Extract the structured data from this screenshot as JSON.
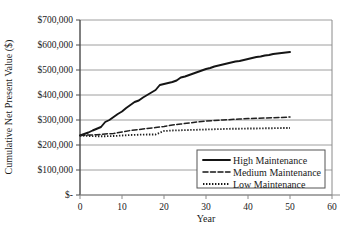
{
  "chart_data": {
    "type": "line",
    "title": "",
    "xlabel": "Year",
    "ylabel": "Cumulative Net Present Value ($)",
    "xlim": [
      0,
      60
    ],
    "ylim": [
      0,
      700000
    ],
    "grid": "horizontal",
    "legend_position": "bottom-right",
    "x_ticks": [
      "0",
      "10",
      "20",
      "30",
      "40",
      "50",
      "60"
    ],
    "x_tick_values": [
      0,
      10,
      20,
      30,
      40,
      50,
      60
    ],
    "y_ticks": [
      "$-",
      "$100,000",
      "$200,000",
      "$300,000",
      "$400,000",
      "$500,000",
      "$600,000",
      "$700,000"
    ],
    "y_tick_values": [
      0,
      100000,
      200000,
      300000,
      400000,
      500000,
      600000,
      700000
    ],
    "series": [
      {
        "name": "High Maintenance",
        "style": "solid",
        "color": "#151515",
        "x": [
          0,
          1,
          2,
          3,
          4,
          5,
          6,
          7,
          8,
          9,
          10,
          11,
          12,
          13,
          14,
          15,
          16,
          17,
          18,
          19,
          20,
          21,
          22,
          23,
          24,
          25,
          26,
          27,
          28,
          29,
          30,
          31,
          32,
          33,
          34,
          35,
          36,
          37,
          38,
          39,
          40,
          41,
          42,
          43,
          44,
          45,
          46,
          47,
          48,
          49,
          50
        ],
        "values": [
          238000,
          244000,
          250000,
          258000,
          265000,
          272000,
          292000,
          300000,
          312000,
          324000,
          334000,
          348000,
          360000,
          372000,
          378000,
          390000,
          400000,
          410000,
          420000,
          440000,
          444000,
          448000,
          452000,
          458000,
          470000,
          474000,
          480000,
          486000,
          492000,
          498000,
          504000,
          508000,
          514000,
          518000,
          522000,
          526000,
          530000,
          534000,
          536000,
          540000,
          544000,
          548000,
          552000,
          554000,
          558000,
          560000,
          564000,
          566000,
          568000,
          570000,
          572000
        ]
      },
      {
        "name": "Medium Maintenance",
        "style": "dashed",
        "color": "#202020",
        "x": [
          0,
          2,
          4,
          6,
          8,
          10,
          12,
          14,
          16,
          18,
          20,
          22,
          24,
          26,
          28,
          30,
          32,
          34,
          36,
          38,
          40,
          42,
          44,
          46,
          48,
          50
        ],
        "values": [
          238000,
          240000,
          241000,
          244000,
          246000,
          252000,
          258000,
          262000,
          266000,
          270000,
          274000,
          280000,
          284000,
          288000,
          292000,
          296000,
          298000,
          300000,
          302000,
          304000,
          306000,
          307000,
          308000,
          309000,
          310000,
          312000
        ]
      },
      {
        "name": "Low Maintenance",
        "style": "dotted",
        "color": "#202020",
        "x": [
          0,
          2,
          4,
          6,
          8,
          10,
          12,
          14,
          16,
          18,
          20,
          22,
          24,
          26,
          28,
          30,
          32,
          34,
          36,
          38,
          40,
          42,
          44,
          46,
          48,
          50
        ],
        "values": [
          238000,
          236000,
          235000,
          235000,
          236000,
          238000,
          240000,
          241000,
          242000,
          242000,
          256000,
          258000,
          259000,
          260000,
          261000,
          262000,
          263000,
          264000,
          265000,
          265000,
          266000,
          266000,
          267000,
          267000,
          268000,
          268000
        ]
      }
    ]
  },
  "legend": {
    "items": [
      {
        "label": "High Maintenance",
        "style": "solid"
      },
      {
        "label": "Medium Maintenance",
        "style": "dashed"
      },
      {
        "label": "Low Maintenance",
        "style": "dotted"
      }
    ]
  }
}
